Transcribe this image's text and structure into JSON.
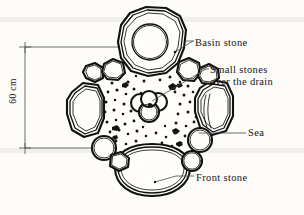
{
  "figure": {
    "type": "technical-illustration",
    "background_color": "#fdfcf8",
    "ink_color": "#111111"
  },
  "dimension": {
    "value": "60 cm",
    "orientation": "vertical",
    "tick_top_y": 47,
    "tick_bottom_y": 148
  },
  "labels": {
    "basin": "Basin stone",
    "small_stones_line1": "Small stones",
    "small_stones_line2": "over the drain",
    "sea": "Sea",
    "front": "Front stone"
  },
  "elements": {
    "basin_stone": "large irregular stone at top with circular water basin carved in it",
    "front_stone": "large rounded stone at bottom",
    "left_stone": "large angular stone at left",
    "right_stone": "large angular stone at right with crease lines",
    "sea": "gravel-filled central area scattered with small pebbles",
    "drain_cluster": "cluster of four overlapping round stones at the centre covering the drain",
    "small_round_stones_count": 8
  }
}
